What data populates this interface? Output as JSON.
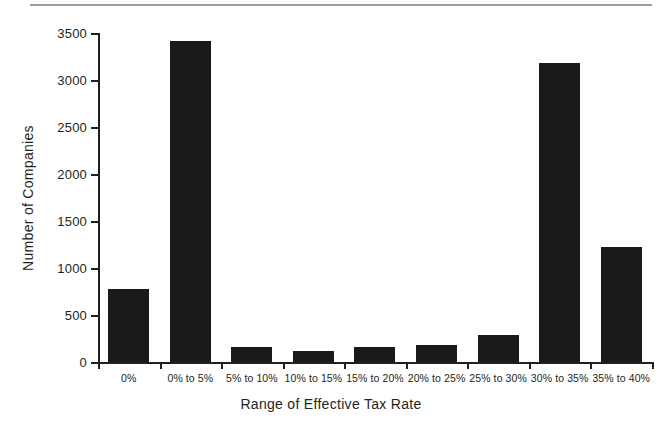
{
  "chart_data": {
    "type": "bar",
    "title": "",
    "xlabel": "Range of Effective Tax Rate",
    "ylabel": "Number of Companies",
    "categories": [
      "0%",
      "0% to 5%",
      "5% to 10%",
      "10% to 15%",
      "15% to 20%",
      "20% to 25%",
      "25% to 30%",
      "30% to 35%",
      "35% to 40%"
    ],
    "values": [
      780,
      3420,
      160,
      120,
      165,
      185,
      290,
      3180,
      1225
    ],
    "ylim": [
      0,
      3500
    ],
    "yticks": [
      0,
      500,
      1000,
      1500,
      2000,
      2500,
      3000,
      3500
    ],
    "ytick_labels": [
      "0",
      "500",
      "1000",
      "1500",
      "2000",
      "2500",
      "3000",
      "3500"
    ],
    "grid": false,
    "legend": null,
    "bar_color": "#1a1a1a",
    "axis_color": "#231f20"
  },
  "figure": {
    "top_rule_color": "#9b9b9b"
  }
}
